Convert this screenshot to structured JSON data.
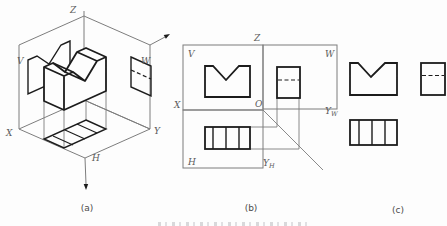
{
  "figure": {
    "type": "engineering-drawing-three-view-projection",
    "colors": {
      "ink": "#1c1c1c",
      "frame": "#7d7d7d",
      "background": "#fdfdfd"
    },
    "captions": {
      "a": "(a)",
      "b": "(b)",
      "c": "(c)"
    },
    "panel_a": {
      "axis_labels": {
        "z": "Z",
        "x": "X",
        "y": "Y"
      },
      "plane_labels": {
        "v": "V",
        "w": "W",
        "h": "H"
      }
    },
    "panel_b": {
      "plane_labels": {
        "v": "V",
        "w": "W",
        "h": "H"
      },
      "axis_labels": {
        "z": "Z",
        "x": "X",
        "o": "O",
        "yw_main": "Y",
        "yw_sub": "W",
        "yh_main": "Y",
        "yh_sub": "H"
      }
    },
    "views": {
      "front": "front-view-with-v-notch",
      "top": "top-view-with-groove-lines",
      "side": "side-view-with-hidden-groove-line"
    }
  }
}
